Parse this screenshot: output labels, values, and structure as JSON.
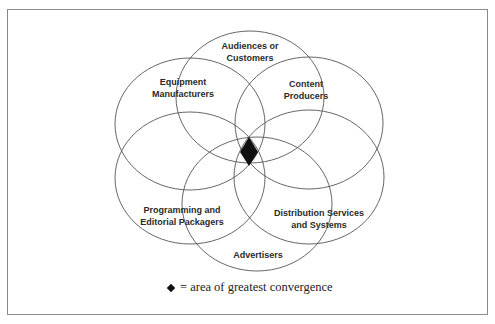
{
  "diagram": {
    "type": "venn",
    "sets": [
      {
        "id": "audiences",
        "label_lines": [
          "Audiences or",
          "Customers"
        ],
        "cx": 250,
        "cy": 97,
        "rx": 74,
        "ry": 66
      },
      {
        "id": "equipment",
        "label_lines": [
          "Equipment",
          "Manufacturers"
        ],
        "cx": 190,
        "cy": 124,
        "rx": 75,
        "ry": 66
      },
      {
        "id": "content",
        "label_lines": [
          "Content",
          "Producers"
        ],
        "cx": 309,
        "cy": 123,
        "rx": 74,
        "ry": 66
      },
      {
        "id": "programming",
        "label_lines": [
          "Programming and",
          "Editorial Packagers"
        ],
        "cx": 190,
        "cy": 178,
        "rx": 75,
        "ry": 66
      },
      {
        "id": "distribution",
        "label_lines": [
          "Distribution Services",
          "and Systems"
        ],
        "cx": 309,
        "cy": 177,
        "rx": 75,
        "ry": 67
      },
      {
        "id": "advertisers",
        "label_lines": [
          "Advertisers"
        ],
        "cx": 257,
        "cy": 204,
        "rx": 75,
        "ry": 67
      }
    ],
    "convergence_marker": {
      "symbol": "diamond",
      "cx": 249,
      "cy": 152,
      "color": "#111111"
    },
    "stroke_color": "#555555"
  },
  "labels": {
    "audiences_1": "Audiences or",
    "audiences_2": "Customers",
    "equipment_1": "Equipment",
    "equipment_2": "Manufacturers",
    "content_1": "Content",
    "content_2": "Producers",
    "programming_1": "Programming and",
    "programming_2": "Editorial Packagers",
    "distribution_1": "Distribution Services",
    "distribution_2": "and Systems",
    "advertisers_1": "Advertisers"
  },
  "legend": {
    "symbol": "diamond",
    "text": "= area of greatest convergence"
  }
}
